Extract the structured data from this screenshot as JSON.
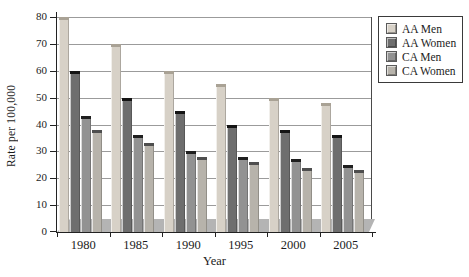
{
  "figure": {
    "width": 469,
    "height": 277
  },
  "chart_data": {
    "type": "bar",
    "title": "",
    "xlabel": "Year",
    "ylabel": "Rate per 100,000",
    "categories": [
      "1980",
      "1985",
      "1990",
      "1995",
      "2000",
      "2005"
    ],
    "series": [
      {
        "name": "AA Men",
        "color": "#d7d1c7",
        "cap_color": "#a9a295",
        "values": [
          80,
          70,
          60,
          55,
          50,
          48
        ]
      },
      {
        "name": "AA Women",
        "color": "#6e6e6e",
        "cap_color": "#141414",
        "values": [
          60,
          50,
          45,
          40,
          38,
          36
        ]
      },
      {
        "name": "CA Men",
        "color": "#929292",
        "cap_color": "#1f1f1f",
        "values": [
          43,
          36,
          30,
          28,
          27,
          25
        ]
      },
      {
        "name": "CA Women",
        "color": "#b7b3ab",
        "cap_color": "#4e4e4e",
        "values": [
          38,
          33,
          28,
          26,
          24,
          23
        ]
      }
    ],
    "ylim": [
      0,
      80
    ],
    "yticks": [
      0,
      10,
      20,
      30,
      40,
      50,
      60,
      70,
      80
    ],
    "grid": true,
    "legend_position": "top-right",
    "colors": {
      "floor": "#b4b4b4",
      "gridline": "#9b9b9b",
      "axis": "#222222",
      "background": "#ffffff"
    }
  }
}
